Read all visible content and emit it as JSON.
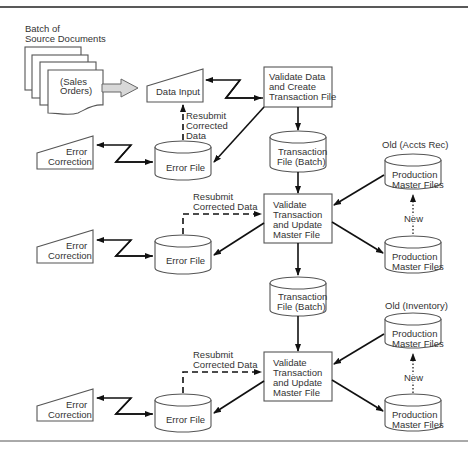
{
  "diagram": {
    "type": "flowchart",
    "title": "",
    "source_documents": {
      "caption": [
        "Batch of",
        "Source Documents"
      ],
      "label": [
        "(Sales",
        "Orders)"
      ]
    },
    "data_input": {
      "label": "Data Input"
    },
    "validate_create": {
      "label": [
        "Validate Data",
        "and Create",
        "Transaction File"
      ]
    },
    "resubmit_1": {
      "label": [
        "Resubmit",
        "Corrected",
        "Data"
      ]
    },
    "error_file_1": {
      "label": "Error File"
    },
    "error_correction_1": {
      "label": [
        "Error",
        "Correction"
      ]
    },
    "transaction_file_1": {
      "label": [
        "Transaction",
        "File (Batch)"
      ]
    },
    "stage_2": {
      "old_caption": "Old (Accts Rec)",
      "old_master": {
        "label": [
          "Production",
          "Master Files"
        ]
      },
      "new_label": "New",
      "new_master": {
        "label": [
          "Production",
          "Master Files"
        ]
      },
      "process": {
        "label": [
          "Validate",
          "Transaction",
          "and Update",
          "Master File"
        ]
      },
      "resubmit": {
        "label": [
          "Resubmit",
          "Corrected Data"
        ]
      },
      "error_file": {
        "label": "Error File"
      },
      "error_correction": {
        "label": [
          "Error",
          "Correction"
        ]
      }
    },
    "transaction_file_2": {
      "label": [
        "Transaction",
        "File (Batch)"
      ]
    },
    "stage_3": {
      "old_caption": "Old (Inventory)",
      "old_master": {
        "label": [
          "Production",
          "Master Files"
        ]
      },
      "new_label": "New",
      "new_master": {
        "label": [
          "Production",
          "Master Files"
        ]
      },
      "process": {
        "label": [
          "Validate",
          "Transaction",
          "and Update",
          "Master File"
        ]
      },
      "resubmit": {
        "label": [
          "Resubmit",
          "Corrected Data"
        ]
      },
      "error_file": {
        "label": "Error File"
      },
      "error_correction": {
        "label": [
          "Error",
          "Correction"
        ]
      }
    }
  }
}
